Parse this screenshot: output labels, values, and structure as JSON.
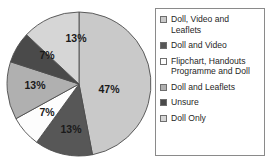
{
  "chart_data": {
    "type": "pie",
    "title": "",
    "labels": [
      "Doll, Video and Leaflets",
      "Doll and Video",
      "Flipchart, Handouts Programme and Doll",
      "Doll and Leaflets",
      "Unsure",
      "Doll Only"
    ],
    "values": [
      47,
      13,
      7,
      13,
      7,
      13
    ],
    "value_labels": [
      "47%",
      "13%",
      "7%",
      "13%",
      "7%",
      "13%"
    ],
    "units": "percent",
    "start_angle_deg": 0,
    "direction": "clockwise",
    "colors": [
      "#c9c9c9",
      "#575757",
      "#fdfdfd",
      "#b0b0b0",
      "#4a4a4a",
      "#d6d6d6"
    ],
    "legend_position": "right",
    "grid": false,
    "xlabel": "",
    "ylabel": ""
  },
  "legend": {
    "items": [
      {
        "label": "Doll, Video and Leaflets",
        "swatch_color": "#c9c9c9",
        "swatch_name": "legend-swatch-doll-video-leaflets"
      },
      {
        "label": "Doll and Video",
        "swatch_color": "#575757",
        "swatch_name": "legend-swatch-doll-and-video"
      },
      {
        "label": "Flipchart, Handouts Programme and Doll",
        "swatch_color": "#fdfdfd",
        "swatch_name": "legend-swatch-flipchart-handouts"
      },
      {
        "label": "Doll and Leaflets",
        "swatch_color": "#b0b0b0",
        "swatch_name": "legend-swatch-doll-and-leaflets"
      },
      {
        "label": "Unsure",
        "swatch_color": "#4a4a4a",
        "swatch_name": "legend-swatch-unsure"
      },
      {
        "label": "Doll Only",
        "swatch_color": "#d6d6d6",
        "swatch_name": "legend-swatch-doll-only"
      }
    ]
  },
  "pie": {
    "center_x": 79,
    "center_y": 84,
    "radius": 72,
    "slice_labels": [
      {
        "text": "47%",
        "x": 109,
        "y": 90
      },
      {
        "text": "13%",
        "x": 71,
        "y": 130
      },
      {
        "text": "7%",
        "x": 47,
        "y": 113
      },
      {
        "text": "13%",
        "x": 35,
        "y": 86
      },
      {
        "text": "7%",
        "x": 47,
        "y": 56
      },
      {
        "text": "13%",
        "x": 76,
        "y": 39
      }
    ]
  }
}
